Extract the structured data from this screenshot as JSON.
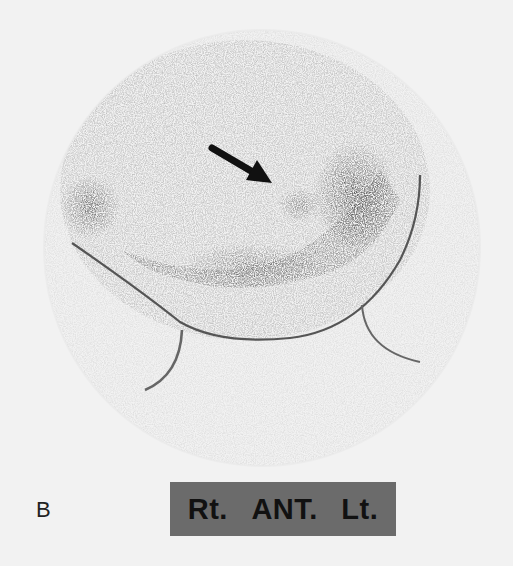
{
  "figure": {
    "panel_label": "B",
    "orientation": {
      "right": "Rt.",
      "view": "ANT.",
      "left": "Lt."
    },
    "annotation": {
      "type": "arrow",
      "icon": "arrow-icon",
      "direction": "down-right"
    },
    "colors": {
      "background": "#f2f2f2",
      "label_bar": "#6b6b6b",
      "uptake_dark": "#2a2a2a",
      "contour_line": "#555555"
    }
  }
}
